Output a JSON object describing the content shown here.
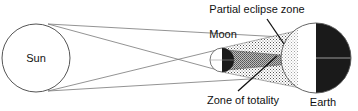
{
  "diagram": {
    "type": "solar-eclipse",
    "labels": {
      "sun": "Sun",
      "moon": "Moon",
      "partial_zone": "Partial eclipse zone",
      "totality_zone": "Zone of totality",
      "earth": "Earth"
    },
    "colors": {
      "outline": "#555555",
      "dark": "#1a1a1a",
      "earth_line": "#9a9a9a",
      "pointer": "#111111"
    }
  }
}
